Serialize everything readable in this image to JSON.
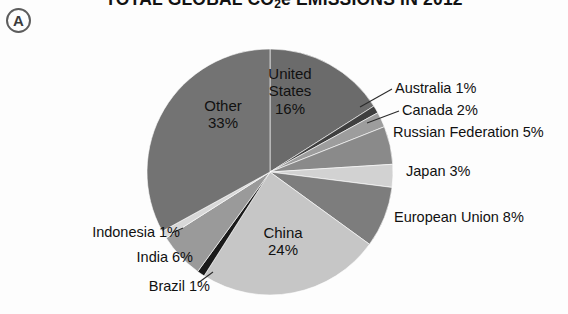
{
  "figure": {
    "badge_label": "A",
    "title_main_before": "TOTAL GLOBAL CO",
    "title_sub": "2",
    "title_main_after": "e EMISSIONS IN 2012",
    "title_plain": "TOTAL GLOBAL CO2e EMISSIONS IN 2012"
  },
  "labels": {
    "united_states": {
      "name": "United",
      "name2": "States",
      "pct": "16%"
    },
    "other": {
      "name": "Other",
      "pct": "33%"
    },
    "china": {
      "name": "China",
      "pct": "24%"
    },
    "australia": "Australia 1%",
    "canada": "Canada 2%",
    "russian_federation": "Russian Federation 5%",
    "japan": "Japan 3%",
    "european_union": "European Union 8%",
    "indonesia": "Indonesia 1%",
    "india": "India 6%",
    "brazil": "Brazil 1%"
  },
  "chart_data": {
    "type": "pie",
    "title": "TOTAL GLOBAL CO2e EMISSIONS IN 2012",
    "xlabel": "",
    "ylabel": "",
    "units": "percent of total global CO2e emissions",
    "legend": "none (direct labels with leader lines)",
    "grid": false,
    "start_angle_deg": 0,
    "direction": "clockwise",
    "total_pct": 100,
    "categories": [
      "United States",
      "Australia",
      "Canada",
      "Russian Federation",
      "Japan",
      "European Union",
      "China",
      "Brazil",
      "India",
      "Indonesia",
      "Other"
    ],
    "values": [
      16,
      1,
      2,
      5,
      3,
      8,
      24,
      1,
      6,
      1,
      33
    ],
    "slices": [
      {
        "label": "United States",
        "value": 16,
        "display": "16%",
        "color": "#6b6b6b",
        "label_placement": "inside"
      },
      {
        "label": "Australia",
        "value": 1,
        "display": "1%",
        "color": "#3f3f3f",
        "label_placement": "outside-right"
      },
      {
        "label": "Canada",
        "value": 2,
        "display": "2%",
        "color": "#9d9d9d",
        "label_placement": "outside-right"
      },
      {
        "label": "Russian Federation",
        "value": 5,
        "display": "5%",
        "color": "#8a8a8a",
        "label_placement": "outside-right"
      },
      {
        "label": "Japan",
        "value": 3,
        "display": "3%",
        "color": "#d2d2d2",
        "label_placement": "outside-right"
      },
      {
        "label": "European Union",
        "value": 8,
        "display": "8%",
        "color": "#7d7d7d",
        "label_placement": "outside-right"
      },
      {
        "label": "China",
        "value": 24,
        "display": "24%",
        "color": "#c6c6c6",
        "label_placement": "inside"
      },
      {
        "label": "Brazil",
        "value": 1,
        "display": "1%",
        "color": "#1a1a1a",
        "label_placement": "outside-left"
      },
      {
        "label": "India",
        "value": 6,
        "display": "6%",
        "color": "#9a9a9a",
        "label_placement": "outside-left"
      },
      {
        "label": "Indonesia",
        "value": 1,
        "display": "1%",
        "color": "#d8d8d8",
        "label_placement": "outside-left"
      },
      {
        "label": "Other",
        "value": 33,
        "display": "33%",
        "color": "#737373",
        "label_placement": "inside"
      }
    ]
  },
  "colors": {
    "background": "#fdfdfd",
    "text": "#111111",
    "leader_line": "#2b2b2b",
    "badge_border": "#5d5d5d"
  }
}
